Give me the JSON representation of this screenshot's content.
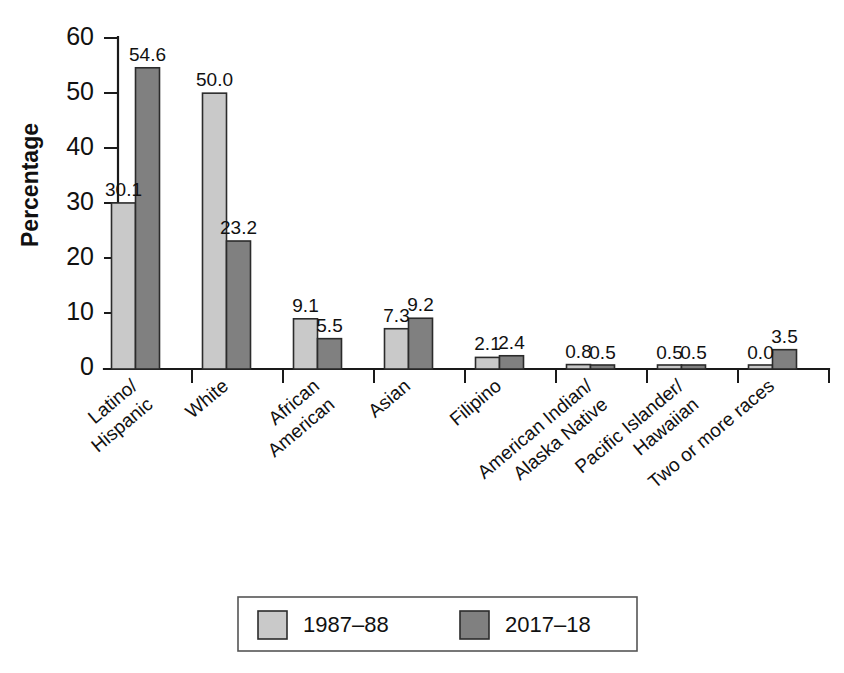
{
  "chart_data": {
    "type": "bar",
    "title": "",
    "subtitle": "",
    "xlabel": "",
    "ylabel": "Percentage",
    "ylim": [
      0,
      60
    ],
    "yticks": [
      0,
      10,
      20,
      30,
      40,
      50,
      60
    ],
    "ytick_labels": [
      "0",
      "10",
      "20",
      "30",
      "40",
      "50",
      "60"
    ],
    "grid": false,
    "legend_position": "bottom",
    "categories": [
      "Latino/\nHispanic",
      "White",
      "African\nAmerican",
      "Asian",
      "Filipino",
      "American Indian/\nAlaska Native",
      "Pacific Islander/\nHawaiian",
      "Two or more races"
    ],
    "category_lines": [
      [
        "Latino/",
        "Hispanic"
      ],
      [
        "White"
      ],
      [
        "African",
        "American"
      ],
      [
        "Asian"
      ],
      [
        "Filipino"
      ],
      [
        "American Indian/",
        "Alaska Native"
      ],
      [
        "Pacific Islander/",
        "Hawaiian"
      ],
      [
        "Two or more races"
      ]
    ],
    "series": [
      {
        "name": "1987–88",
        "color": "#c9c9c9",
        "values": [
          30.1,
          50.0,
          9.1,
          7.3,
          2.1,
          0.8,
          0.5,
          0.0
        ],
        "labels": [
          "30.1",
          "50.0",
          "9.1",
          "7.3",
          "2.1",
          "0.8",
          "0.5",
          "0.0"
        ]
      },
      {
        "name": "2017–18",
        "color": "#808080",
        "values": [
          54.6,
          23.2,
          5.5,
          9.2,
          2.4,
          0.5,
          0.5,
          3.5
        ],
        "labels": [
          "54.6",
          "23.2",
          "5.5",
          "9.2",
          "2.4",
          "0.5",
          "0.5",
          "3.5"
        ]
      }
    ]
  },
  "legend": {
    "entries": [
      {
        "label": "1987–88",
        "color": "#c9c9c9"
      },
      {
        "label": "2017–18",
        "color": "#808080"
      }
    ]
  },
  "axis": {
    "y_title": "Percentage",
    "y_tick_labels": [
      "60",
      "50",
      "40",
      "30",
      "20",
      "10",
      "0"
    ]
  }
}
